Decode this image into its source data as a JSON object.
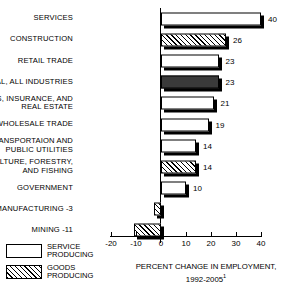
{
  "chart_data": {
    "type": "bar",
    "orientation": "horizontal",
    "title": "",
    "xlabel": "PERCENT CHANGE IN EMPLOYMENT, 1992-2005",
    "ylabel": "",
    "xlim": [
      -20,
      40
    ],
    "xticks": [
      -20,
      -10,
      0,
      10,
      20,
      30,
      40
    ],
    "xtick_labels": [
      "-20",
      "-10",
      "0",
      "10",
      "20",
      "30",
      "40"
    ],
    "grid": false,
    "legend_position": "bottom-left",
    "categories": [
      "SERVICES",
      "CONSTRUCTION",
      "RETAIL TRADE",
      "TOTAL, ALL INDUSTRIES",
      "FINANCES, INSURANCE, AND REAL ESTATE",
      "WHOLESALE TRADE",
      "TRANSPORTAION AND PUBLIC UTILITIES",
      "AGRICULTURE, FORESTRY, AND FISHING",
      "GOVERNMENT",
      "MANUFACTURING",
      "MINING"
    ],
    "values": [
      40,
      26,
      23,
      23,
      21,
      19,
      14,
      14,
      10,
      -3,
      -11
    ],
    "series_groups": [
      "service",
      "goods",
      "service",
      "total",
      "service",
      "service",
      "service",
      "goods",
      "service",
      "goods",
      "goods"
    ],
    "legend": [
      {
        "key": "service",
        "label": "SERVICE\nPRODUCING"
      },
      {
        "key": "goods",
        "label": "GOODS\nPRODUCING"
      }
    ]
  },
  "rows": [
    {
      "label": "SERVICES",
      "value": 40,
      "value_text": "40",
      "group": "service"
    },
    {
      "label": "CONSTRUCTION",
      "value": 26,
      "value_text": "26",
      "group": "goods"
    },
    {
      "label": "RETAIL TRADE",
      "value": 23,
      "value_text": "23",
      "group": "service"
    },
    {
      "label": "TOTAL, ALL INDUSTRIES",
      "value": 23,
      "value_text": "23",
      "group": "total"
    },
    {
      "label": "FINANCES, INSURANCE, AND\nREAL ESTATE",
      "value": 21,
      "value_text": "21",
      "group": "service"
    },
    {
      "label": "WHOLESALE TRADE",
      "value": 19,
      "value_text": "19",
      "group": "service"
    },
    {
      "label": "TRANSPORTAION AND\nPUBLIC UTILITIES",
      "value": 14,
      "value_text": "14",
      "group": "service"
    },
    {
      "label": "AGRICULTURE, FORESTRY,\nAND FISHING",
      "value": 14,
      "value_text": "14",
      "group": "goods"
    },
    {
      "label": "GOVERNMENT",
      "value": 10,
      "value_text": "10",
      "group": "service"
    },
    {
      "label": "MANUFACTURING  -3",
      "value": -3,
      "value_text": "",
      "group": "goods"
    },
    {
      "label": "MINING  -11",
      "value": -11,
      "value_text": "",
      "group": "goods"
    }
  ],
  "axis": {
    "ticks": [
      {
        "value": -20,
        "label": "-20"
      },
      {
        "value": -10,
        "label": "-10"
      },
      {
        "value": 0,
        "label": "0"
      },
      {
        "value": 10,
        "label": "10"
      },
      {
        "value": 20,
        "label": "20"
      },
      {
        "value": 30,
        "label": "30"
      },
      {
        "value": 40,
        "label": "40"
      }
    ]
  },
  "legend": {
    "service_label": "SERVICE\nPRODUCING",
    "goods_label": "GOODS\nPRODUCING"
  },
  "caption": {
    "line1": "PERCENT CHANGE IN EMPLOYMENT,",
    "line2": "1992-2005",
    "footnote_marker": "1"
  },
  "colors": {
    "ink": "#000000",
    "paper": "#ffffff",
    "total_fill": "#3a3a3a"
  }
}
